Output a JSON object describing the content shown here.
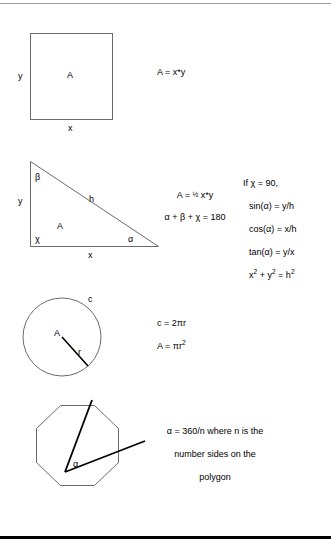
{
  "page": {
    "background_color": "#ffffff",
    "ink_color": "#000000",
    "rule_color_top": "#9a9a9a",
    "rule_color_bottom": "#000000",
    "width": 331,
    "height": 547
  },
  "figures": [
    {
      "id": "square",
      "shape": "square",
      "labels": {
        "area": "A",
        "height": "y",
        "width": "x"
      },
      "formula_lines": [
        "A = x*y"
      ]
    },
    {
      "id": "triangle",
      "shape": "right-triangle",
      "labels": {
        "area": "A",
        "vertical_side": "y",
        "horizontal_side": "x",
        "hypotenuse": "h",
        "angle_top": "β",
        "angle_bottom_left": "χ",
        "angle_bottom_right": "α"
      },
      "formula_lines": [
        "A = ½ x*y",
        "α + β + χ = 180"
      ],
      "formula_area_prefix": "A = ",
      "formula_fraction": "1/2",
      "formula_area_suffix": " x*y",
      "formula_angle_sum": "α + β + χ = 180",
      "side_note_lines": [
        "If χ = 90,",
        "sin(α) = y/h",
        "cos(α) = x/h",
        "tan(α) = y/x",
        "x² + y² = h²"
      ],
      "side_note": {
        "condition": "If χ = 90,",
        "sin": "sin(α) = y/h",
        "cos": "cos(α) = x/h",
        "tan": "tan(α) = y/x",
        "pythagoras_base": "x",
        "pythagoras_exp1": "2",
        "pythagoras_mid": " + y",
        "pythagoras_exp2": "2",
        "pythagoras_eq": " = h",
        "pythagoras_exp3": "2"
      }
    },
    {
      "id": "circle",
      "shape": "circle",
      "labels": {
        "area": "A",
        "radius": "r",
        "circumference": "c"
      },
      "formula_lines": [
        "c = 2πr",
        "A = πr²"
      ],
      "formula_circumference": "c = 2πr",
      "formula_area_prefix": "A = πr",
      "formula_area_exponent": "2"
    },
    {
      "id": "polygon",
      "shape": "octagon",
      "labels": {
        "angle": "α"
      },
      "note_lines": [
        "α = 360/n where n is the",
        "number sides on the",
        "polygon"
      ],
      "note_text": "α = 360/n where n is the\nnumber sides on the\npolygon"
    }
  ]
}
